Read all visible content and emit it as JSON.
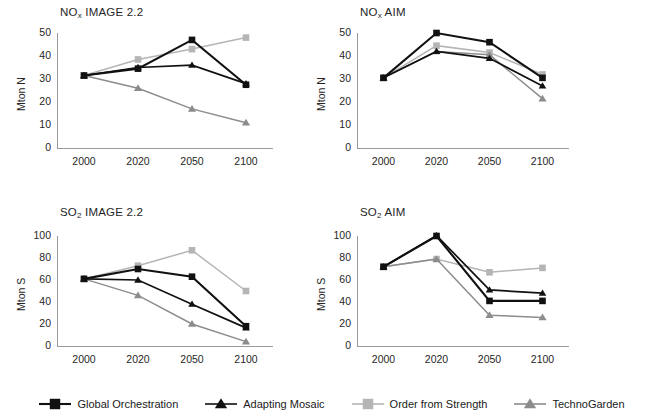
{
  "figure": {
    "series_names": [
      "Global Orchestration",
      "Adapting Mosaic",
      "Order from Strength",
      "TechnoGarden"
    ],
    "series_colors": [
      "#111111",
      "#111111",
      "#b5b5b5",
      "#8c8c8c"
    ],
    "series_markers": [
      "square",
      "triangle",
      "square",
      "triangle"
    ],
    "categories": [
      "2000",
      "2020",
      "2050",
      "2100"
    ]
  },
  "legend": {
    "items": [
      {
        "label": "Global Orchestration",
        "marker": "square",
        "color": "#111111"
      },
      {
        "label": "Adapting Mosaic",
        "marker": "triangle",
        "color": "#111111"
      },
      {
        "label": "Order from Strength",
        "marker": "square",
        "color": "#b5b5b5"
      },
      {
        "label": "TechnoGarden",
        "marker": "triangle",
        "color": "#8c8c8c"
      }
    ]
  },
  "chart_data": [
    {
      "id": "nox-image",
      "type": "line",
      "title": "NOx IMAGE 2.2",
      "title_base": "NO",
      "title_sub": "x",
      "title_rest": " IMAGE 2.2",
      "xlabel": "",
      "ylabel": "Mton N",
      "categories": [
        "2000",
        "2020",
        "2050",
        "2100"
      ],
      "ylim": [
        0,
        50
      ],
      "yticks": [
        0,
        10,
        20,
        30,
        40,
        50
      ],
      "grid": false,
      "series": [
        {
          "name": "Global Orchestration",
          "values": [
            31.5,
            34.5,
            47.0,
            27.5
          ]
        },
        {
          "name": "Adapting Mosaic",
          "values": [
            31.5,
            35.0,
            36.0,
            28.0
          ]
        },
        {
          "name": "Order from Strength",
          "values": [
            31.5,
            38.5,
            43.0,
            48.0
          ]
        },
        {
          "name": "TechnoGarden",
          "values": [
            31.5,
            26.0,
            17.0,
            11.0
          ]
        }
      ]
    },
    {
      "id": "nox-aim",
      "type": "line",
      "title": "NOx AIM",
      "title_base": "NO",
      "title_sub": "x",
      "title_rest": " AIM",
      "xlabel": "",
      "ylabel": "Mton N",
      "categories": [
        "2000",
        "2020",
        "2050",
        "2100"
      ],
      "ylim": [
        0,
        50
      ],
      "yticks": [
        0,
        10,
        20,
        30,
        40,
        50
      ],
      "grid": false,
      "series": [
        {
          "name": "Global Orchestration",
          "values": [
            30.5,
            50.0,
            46.0,
            30.5
          ]
        },
        {
          "name": "Adapting Mosaic",
          "values": [
            30.5,
            42.0,
            39.0,
            27.0
          ]
        },
        {
          "name": "Order from Strength",
          "values": [
            30.5,
            44.5,
            41.5,
            32.0
          ]
        },
        {
          "name": "TechnoGarden",
          "values": [
            30.5,
            42.0,
            40.5,
            21.5
          ]
        }
      ]
    },
    {
      "id": "so2-image",
      "type": "line",
      "title": "SO2 IMAGE 2.2",
      "title_base": "SO",
      "title_sub": "2",
      "title_rest": " IMAGE 2.2",
      "xlabel": "",
      "ylabel": "Mton S",
      "categories": [
        "2000",
        "2020",
        "2050",
        "2100"
      ],
      "ylim": [
        0,
        100
      ],
      "yticks": [
        0,
        20,
        40,
        60,
        80,
        100
      ],
      "grid": false,
      "series": [
        {
          "name": "Global Orchestration",
          "values": [
            61.0,
            70.0,
            63.0,
            18.0
          ]
        },
        {
          "name": "Adapting Mosaic",
          "values": [
            61.0,
            60.0,
            38.0,
            16.5
          ]
        },
        {
          "name": "Order from Strength",
          "values": [
            61.0,
            73.0,
            87.0,
            50.0
          ]
        },
        {
          "name": "TechnoGarden",
          "values": [
            61.0,
            46.0,
            20.0,
            4.0
          ]
        }
      ]
    },
    {
      "id": "so2-aim",
      "type": "line",
      "title": "SO2 AIM",
      "title_base": "SO",
      "title_sub": "2",
      "title_rest": " AIM",
      "xlabel": "",
      "ylabel": "Mton S",
      "categories": [
        "2000",
        "2020",
        "2050",
        "2100"
      ],
      "ylim": [
        0,
        100
      ],
      "yticks": [
        0,
        20,
        40,
        60,
        80,
        100
      ],
      "grid": false,
      "series": [
        {
          "name": "Global Orchestration",
          "values": [
            72.0,
            100.0,
            41.0,
            41.0
          ]
        },
        {
          "name": "Adapting Mosaic",
          "values": [
            72.0,
            100.5,
            51.0,
            48.0
          ]
        },
        {
          "name": "Order from Strength",
          "values": [
            72.0,
            79.0,
            67.0,
            71.0
          ]
        },
        {
          "name": "TechnoGarden",
          "values": [
            72.0,
            79.0,
            28.0,
            26.0
          ]
        }
      ]
    }
  ]
}
